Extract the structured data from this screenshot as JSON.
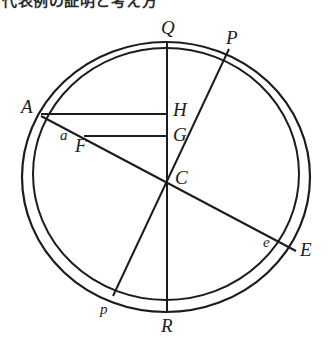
{
  "figure": {
    "caption_partial": "代表例の証明と考え方",
    "ink_color": "#1c1c1c",
    "background_color": "#ffffff",
    "circles": [
      {
        "name": "outer-circle",
        "cx": 166,
        "cy": 177,
        "r": 144,
        "stroke_width": 2.2
      },
      {
        "name": "inner-circle",
        "cx": 166,
        "cy": 174,
        "r": 133,
        "stroke_width": 2.0
      }
    ],
    "lines": [
      {
        "name": "diameter-QR",
        "from": "Q",
        "to": "R",
        "x1": 167,
        "y1": 42,
        "x2": 167,
        "y2": 312
      },
      {
        "name": "diameter-Pp",
        "from": "P",
        "to": "p",
        "x1": 229,
        "y1": 49,
        "x2": 113,
        "y2": 296
      },
      {
        "name": "chord-AE",
        "from": "A",
        "to": "E",
        "x1": 41,
        "y1": 116,
        "x2": 296,
        "y2": 251
      },
      {
        "name": "segment-AH",
        "from": "A",
        "to": "H",
        "x1": 41,
        "y1": 114,
        "x2": 167,
        "y2": 114
      },
      {
        "name": "segment-FG",
        "from": "F",
        "to": "G",
        "x1": 84,
        "y1": 136,
        "x2": 167,
        "y2": 136
      }
    ],
    "points": [
      {
        "name": "point-Q",
        "label": "Q",
        "case": "upper",
        "x": 161,
        "y": 18
      },
      {
        "name": "point-P",
        "label": "P",
        "case": "upper",
        "x": 226,
        "y": 28
      },
      {
        "name": "point-A",
        "label": "A",
        "case": "upper",
        "x": 21,
        "y": 97
      },
      {
        "name": "point-H",
        "label": "H",
        "case": "upper",
        "x": 173,
        "y": 100
      },
      {
        "name": "point-G",
        "label": "G",
        "case": "upper",
        "x": 173,
        "y": 125
      },
      {
        "name": "point-a",
        "label": "a",
        "case": "lower",
        "x": 60,
        "y": 128
      },
      {
        "name": "point-F",
        "label": "F",
        "case": "upper",
        "x": 75,
        "y": 136
      },
      {
        "name": "point-C",
        "label": "C",
        "case": "upper",
        "x": 175,
        "y": 168
      },
      {
        "name": "point-e",
        "label": "e",
        "case": "lower",
        "x": 263,
        "y": 235
      },
      {
        "name": "point-E",
        "label": "E",
        "case": "upper",
        "x": 300,
        "y": 240
      },
      {
        "name": "point-p",
        "label": "p",
        "case": "lower",
        "x": 100,
        "y": 302
      },
      {
        "name": "point-R",
        "label": "R",
        "case": "upper",
        "x": 161,
        "y": 316
      }
    ]
  }
}
